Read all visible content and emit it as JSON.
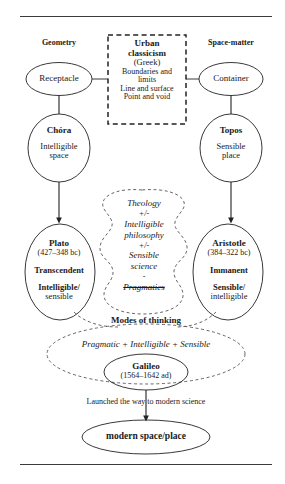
{
  "figure": {
    "type": "concept-flow-diagram",
    "title_text": "",
    "rules": {
      "top_label": "top-rule",
      "bottom_label": "bottom-rule"
    }
  },
  "columns": {
    "left_heading": "Geometry",
    "right_heading": "Space-matter"
  },
  "nodes": {
    "receptacle": {
      "label": "Receptacle"
    },
    "container": {
      "label": "Container"
    },
    "urban_box": {
      "line1": "Urban",
      "line2": "classicism",
      "line3": "(Greek)",
      "line4": "Boundaries and",
      "line5": "limits",
      "line6": "Line and surface",
      "line7": "Point and void"
    },
    "chora": {
      "title": "Chóra",
      "line1": "Intelligible",
      "line2": "space"
    },
    "topos": {
      "title": "Topos",
      "line1": "Sensible",
      "line2": "place"
    },
    "plato": {
      "title": "Plato",
      "dates": "(427–348 bc)",
      "attr1": "Transcendent",
      "attr2a": "Intelligible/",
      "attr2b": "sensible"
    },
    "aristotle": {
      "title": "Aristotle",
      "dates": "(384–322 bc)",
      "attr1": "Immanent",
      "attr2a": "Sensible/",
      "attr2b": "intelligible"
    },
    "center_blob": {
      "l1": "Theology",
      "l2": "+/-",
      "l3": "Intelligible",
      "l4": "philosophy",
      "l5": "+/-",
      "l6": "Sensible",
      "l7": "science",
      "l8": "-",
      "l9": "Pragmatics"
    },
    "modes": {
      "label": "Modes of thinking"
    },
    "synthesis": {
      "label": "Pragmatic + Intelligible + Sensible"
    },
    "galileo": {
      "title": "Galileo",
      "dates": "(1564–1642 ad)"
    },
    "arrow_caption": {
      "label": "Launched the way to modern science"
    },
    "modern": {
      "label": "modern space/place"
    }
  },
  "colors": {
    "stroke": "#222222",
    "dashed_stroke": "#4a4a4a",
    "text": "#1a1a1a",
    "rule": "#3a3a3a",
    "background": "#ffffff"
  }
}
